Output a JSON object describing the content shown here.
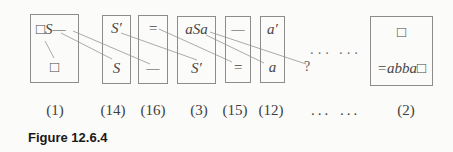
{
  "figure_caption": "Figure 12.6.4",
  "dominoes": [
    {
      "label": "(1)",
      "top": "□S—",
      "bottom": "□"
    },
    {
      "label": "(14)",
      "top": "S′",
      "bottom": "S"
    },
    {
      "label": "(16)",
      "top": "=",
      "bottom": "—"
    },
    {
      "label": "(3)",
      "top": "aSa",
      "bottom": "S′"
    },
    {
      "label": "(15)",
      "top": "—",
      "bottom": "="
    },
    {
      "label": "(12)",
      "top": "a′",
      "bottom": "a"
    },
    {
      "label": "(2)",
      "top": "□",
      "bottom": "=abba□"
    }
  ],
  "ellipsis": {
    "mid_left": "···",
    "mid_right": "···",
    "label_left": "...",
    "label_right": "..."
  },
  "question_mark": "?",
  "connections": [
    {
      "from": "domino-1-top-square",
      "to": "domino-1-bottom-square"
    },
    {
      "from": "domino-1-top-S",
      "to": "domino-14-bottom-S"
    },
    {
      "from": "domino-1-top-dash",
      "to": "domino-16-bottom-dash"
    },
    {
      "from": "domino-14-top-Sprime",
      "to": "domino-3-bottom-Sprime"
    },
    {
      "from": "domino-16-top-equals",
      "to": "domino-15-bottom-equals"
    },
    {
      "from": "domino-3-top-a",
      "to": "domino-12-bottom-a"
    },
    {
      "from": "domino-3-top-Sa",
      "to": "question-mark"
    }
  ],
  "colors": {
    "background": "#fbfbf9",
    "box_border": "#8c8c8c",
    "connector_line": "#a2a2a2",
    "symbol_text": "#474747",
    "caption_text": "#191919"
  }
}
